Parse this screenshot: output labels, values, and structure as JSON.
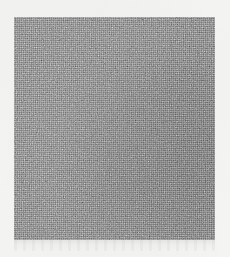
{
  "canvas": {
    "width": 230,
    "height": 257,
    "background_color": "#f5f5f3"
  },
  "image": {
    "type": "noise-texture",
    "description": "Grayscale random noise / film-grain texture patch",
    "patch": {
      "x": 14,
      "y": 17,
      "width": 201,
      "height": 223,
      "base_color": "#808080",
      "has_border": false,
      "grain": "fine per-pixel salt-and-pepper, isotropic, no directional structure",
      "tone_range": [
        "#5a5a5a",
        "#a6a6a6"
      ]
    },
    "artifacts": {
      "compression_ringing": {
        "present": true,
        "x": 14,
        "y": 240,
        "width": 201,
        "height": 11,
        "note": "faint horizontal JPEG ringing below the patch bottom edge"
      }
    },
    "text_content": "none",
    "alt_text": "A square patch of uniform grayscale noise on an off-white background"
  }
}
